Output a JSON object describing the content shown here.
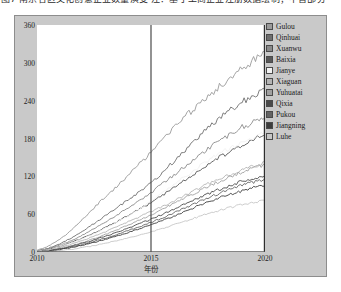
{
  "caption": {
    "text": "图7  南京各区文化创意企业数量演变   注：基于工商企业注册数据绘制；不含部分"
  },
  "chart_data": {
    "type": "line",
    "title": "",
    "xlabel": "年份",
    "ylabel": "文化创意企业数量/家",
    "xlim": [
      2010,
      2020
    ],
    "ylim": [
      0,
      360
    ],
    "xticks": [
      "2010",
      "2015",
      "2020"
    ],
    "yticks": [
      "0",
      "60",
      "120",
      "180",
      "240",
      "300",
      "360"
    ],
    "grid": false,
    "legend_position": "right-outside",
    "annotations": [
      {
        "type": "vline",
        "x": 2015,
        "color": "#4a4a4a"
      },
      {
        "type": "vline",
        "x": 2020,
        "color": "#2e2e2e"
      }
    ],
    "x": [
      2010,
      2010.5,
      2011,
      2011.5,
      2012,
      2012.5,
      2013,
      2013.5,
      2014,
      2014.5,
      2015,
      2015.5,
      2016,
      2016.5,
      2017,
      2017.5,
      2018,
      2018.5,
      2019,
      2019.5,
      2020
    ],
    "series": [
      {
        "name": "Gulou",
        "color": "#9a9a9a",
        "values": [
          3,
          9,
          20,
          34,
          52,
          70,
          88,
          104,
          122,
          140,
          158,
          176,
          196,
          214,
          232,
          248,
          262,
          278,
          292,
          304,
          316
        ]
      },
      {
        "name": "Qinhuai",
        "color": "#6e6e6e",
        "values": [
          2,
          6,
          13,
          22,
          33,
          45,
          58,
          70,
          83,
          96,
          110,
          126,
          144,
          162,
          180,
          196,
          212,
          226,
          238,
          248,
          258
        ]
      },
      {
        "name": "Xuanwu",
        "color": "#8a8a8a",
        "values": [
          2,
          5,
          11,
          18,
          27,
          37,
          47,
          58,
          70,
          82,
          94,
          108,
          122,
          136,
          150,
          164,
          176,
          188,
          198,
          206,
          214
        ]
      },
      {
        "name": "Baixia",
        "color": "#575757",
        "values": [
          1,
          4,
          9,
          15,
          22,
          30,
          39,
          48,
          58,
          68,
          78,
          90,
          102,
          114,
          126,
          138,
          150,
          160,
          170,
          178,
          186
        ]
      },
      {
        "name": "Jianye",
        "color": "#f2f2f2",
        "values": [
          1,
          3,
          8,
          14,
          21,
          29,
          38,
          47,
          57,
          68,
          80,
          93,
          107,
          120,
          133,
          145,
          156,
          166,
          175,
          182,
          190
        ]
      },
      {
        "name": "Xiaguan",
        "color": "#b4b4b4",
        "values": [
          1,
          3,
          7,
          12,
          18,
          25,
          32,
          40,
          48,
          56,
          64,
          72,
          81,
          90,
          99,
          108,
          116,
          123,
          130,
          136,
          142
        ]
      },
      {
        "name": "Yuhuatai",
        "color": "#a0a0a0",
        "values": [
          1,
          2,
          6,
          10,
          15,
          21,
          28,
          35,
          43,
          51,
          59,
          68,
          77,
          86,
          95,
          104,
          112,
          120,
          127,
          133,
          139
        ]
      },
      {
        "name": "Qixia",
        "color": "#4a4a4a",
        "values": [
          0,
          2,
          5,
          9,
          14,
          19,
          25,
          31,
          38,
          45,
          52,
          60,
          68,
          76,
          84,
          92,
          99,
          106,
          112,
          117,
          122
        ]
      },
      {
        "name": "Pukou",
        "color": "#636363",
        "values": [
          0,
          2,
          4,
          8,
          12,
          17,
          22,
          28,
          34,
          40,
          47,
          54,
          62,
          70,
          78,
          86,
          93,
          100,
          106,
          111,
          116
        ]
      },
      {
        "name": "Jiangning",
        "color": "#3d3d3d",
        "values": [
          0,
          1,
          4,
          7,
          11,
          15,
          20,
          25,
          31,
          37,
          43,
          50,
          57,
          64,
          72,
          79,
          86,
          92,
          97,
          102,
          106
        ]
      },
      {
        "name": "Luhe",
        "color": "#c6c6c6",
        "values": [
          0,
          1,
          2,
          4,
          7,
          10,
          14,
          18,
          22,
          27,
          32,
          37,
          43,
          49,
          55,
          61,
          66,
          71,
          75,
          79,
          82
        ]
      }
    ]
  }
}
